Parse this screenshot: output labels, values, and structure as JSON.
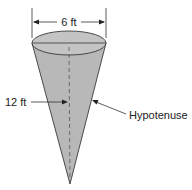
{
  "figure": {
    "type": "cone-diagram",
    "labels": {
      "diameter": "6 ft",
      "height": "12 ft",
      "slant": "Hypotenuse"
    },
    "colors": {
      "fill": "#b8b8b8",
      "stroke": "#3a3a3a",
      "top_fill": "#c4c4c4",
      "text": "#222222"
    }
  }
}
